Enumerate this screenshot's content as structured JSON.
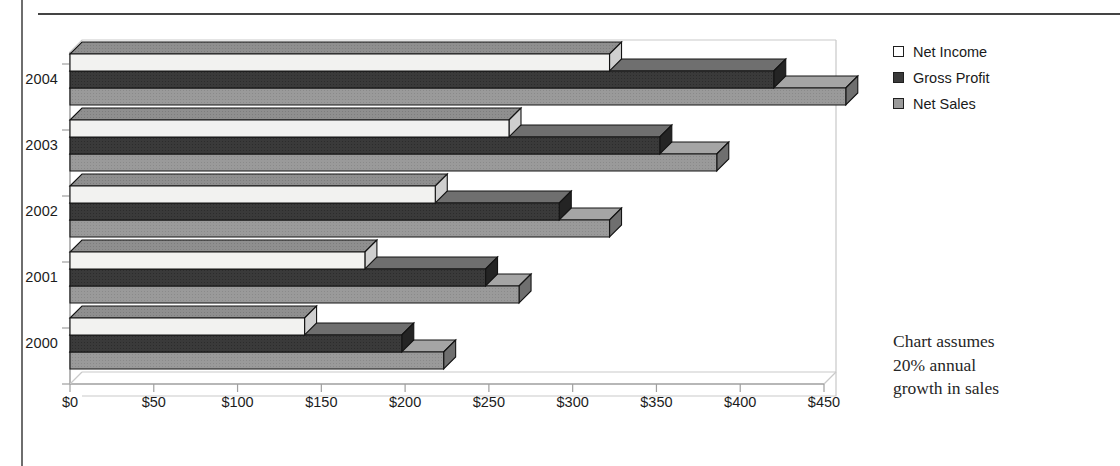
{
  "chart_data": {
    "type": "bar",
    "orientation": "horizontal",
    "style": "3d-stacked-rows",
    "title": "",
    "xlabel": "",
    "ylabel": "",
    "categories": [
      "2004",
      "2003",
      "2002",
      "2001",
      "2000"
    ],
    "category_order_top_to_bottom": [
      "2004",
      "2003",
      "2002",
      "2001",
      "2000"
    ],
    "series": [
      {
        "name": "Net Income",
        "color": "#f2f2f0",
        "values": [
          322,
          262,
          218,
          176,
          140
        ]
      },
      {
        "name": "Gross Profit",
        "color": "#3a3a3a",
        "values": [
          420,
          352,
          292,
          248,
          198
        ]
      },
      {
        "name": "Net Sales",
        "color": "#9a9a9a",
        "values": [
          463,
          386,
          322,
          268,
          223
        ]
      }
    ],
    "xlim": [
      0,
      450
    ],
    "xtick_values": [
      0,
      50,
      100,
      150,
      200,
      250,
      300,
      350,
      400,
      450
    ],
    "xtick_labels": [
      "$0",
      "$50",
      "$100",
      "$150",
      "$200",
      "$250",
      "$300",
      "$350",
      "$400",
      "$450"
    ],
    "grid": false,
    "legend_position": "right-top",
    "annotations": [
      "Chart assumes 20% annual growth in sales"
    ]
  },
  "legend": {
    "items": [
      {
        "label": "Net Income",
        "swatch": "#ffffff"
      },
      {
        "label": "Gross Profit",
        "swatch": "#3a3a3a"
      },
      {
        "label": "Net Sales",
        "swatch": "#9a9a9a"
      }
    ]
  },
  "annotation": {
    "line1": "Chart assumes",
    "line2": "20% annual",
    "line3": "growth in sales"
  },
  "axis": {
    "categories": [
      "2004",
      "2003",
      "2002",
      "2001",
      "2000"
    ],
    "xticks": [
      "$0",
      "$50",
      "$100",
      "$150",
      "$200",
      "$250",
      "$300",
      "$350",
      "$400",
      "$450"
    ]
  },
  "colors": {
    "net_income": "#f2f2f0",
    "gross_profit": "#3a3a3a",
    "net_sales": "#9a9a9a",
    "top_face": "#8f8f8f",
    "outline": "#141414",
    "axis_line": "#b5b5b5"
  }
}
